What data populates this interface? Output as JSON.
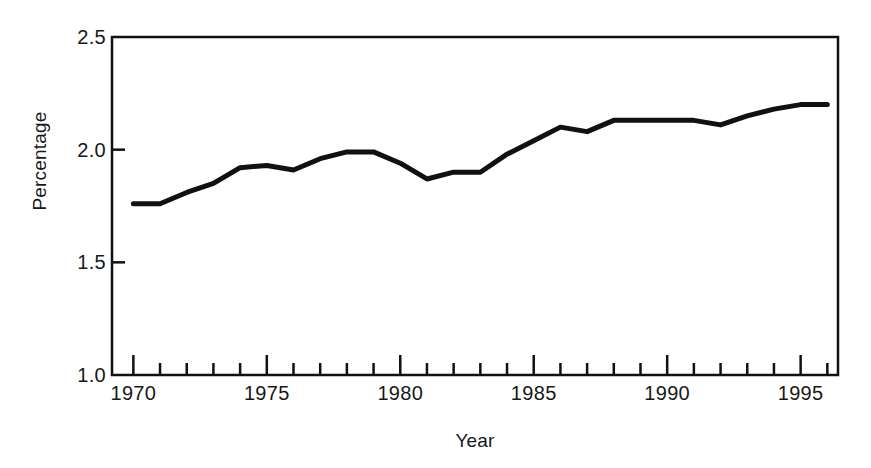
{
  "chart_data": {
    "type": "line",
    "title": "",
    "subtitle": "",
    "xlabel": "Year",
    "ylabel": "Percentage",
    "xlim": [
      1969.2,
      1996.4
    ],
    "ylim": [
      1.0,
      2.5
    ],
    "grid": false,
    "legend": null,
    "legend_position": "none",
    "line_color": "#111111",
    "line_width": 5,
    "x_major_ticks": [
      1970,
      1975,
      1980,
      1985,
      1990,
      1995
    ],
    "x_major_tick_labels": [
      "1970",
      "1975",
      "1980",
      "1985",
      "1990",
      "1995"
    ],
    "x_minor_ticks": [
      1971,
      1972,
      1973,
      1974,
      1976,
      1977,
      1978,
      1979,
      1981,
      1982,
      1983,
      1984,
      1986,
      1987,
      1988,
      1989,
      1991,
      1992,
      1993,
      1994,
      1996
    ],
    "y_major_ticks": [
      1.0,
      1.5,
      2.0,
      2.5
    ],
    "y_major_tick_labels": [
      "1.0",
      "1.5",
      "2.0",
      "2.5"
    ],
    "x": [
      1970,
      1971,
      1972,
      1973,
      1974,
      1975,
      1976,
      1977,
      1978,
      1979,
      1980,
      1981,
      1982,
      1983,
      1984,
      1985,
      1986,
      1987,
      1988,
      1989,
      1990,
      1991,
      1992,
      1993,
      1994,
      1995,
      1996
    ],
    "values": [
      1.76,
      1.76,
      1.81,
      1.85,
      1.92,
      1.93,
      1.91,
      1.96,
      1.99,
      1.99,
      1.94,
      1.87,
      1.9,
      1.9,
      1.98,
      2.04,
      2.1,
      2.08,
      2.13,
      2.13,
      2.13,
      2.13,
      2.11,
      2.15,
      2.18,
      2.2,
      2.2
    ],
    "series": [
      {
        "name": "Percentage",
        "values": [
          1.76,
          1.76,
          1.81,
          1.85,
          1.92,
          1.93,
          1.91,
          1.96,
          1.99,
          1.99,
          1.94,
          1.87,
          1.9,
          1.9,
          1.98,
          2.04,
          2.1,
          2.08,
          2.13,
          2.13,
          2.13,
          2.13,
          2.11,
          2.15,
          2.18,
          2.2,
          2.2
        ]
      }
    ]
  }
}
